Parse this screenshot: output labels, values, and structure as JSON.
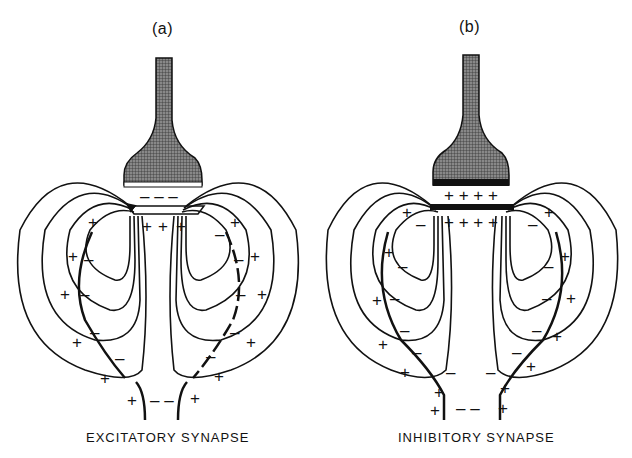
{
  "figure": {
    "panels": [
      {
        "id": "a",
        "label": "(a)",
        "caption": "EXCITATORY SYNAPSE",
        "presynaptic_terminal": "shaded bouton with white synaptic cleft edge",
        "cleft_charges": "- - -",
        "postsynaptic_charges_inside": "+ + +"
      },
      {
        "id": "b",
        "label": "(b)",
        "caption": "INHIBITORY SYNAPSE",
        "presynaptic_terminal": "shaded bouton with black synaptic edge",
        "cleft_charges": "+ + + +",
        "postsynaptic_charges_inside": "+ + + +"
      }
    ],
    "colors": {
      "ink": "#111111",
      "background": "#ffffff",
      "shading": "#6a6a6a"
    }
  }
}
